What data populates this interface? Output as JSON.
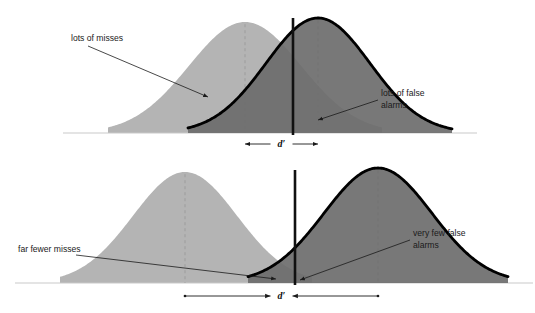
{
  "figure": {
    "panels": [
      {
        "id": "top",
        "name": "liberal-criterion-panel",
        "annotations": [
          {
            "id": "misses",
            "name": "lots-of-misses",
            "text": "lots of misses",
            "lines": [
              "lots of misses"
            ]
          },
          {
            "id": "false-alarms",
            "name": "lots-of-false-alarms",
            "text": "lots of false alarms",
            "lines": [
              "lots of false",
              "alarms"
            ]
          }
        ],
        "dprime_label": "d′",
        "criterion_label": "criterion"
      },
      {
        "id": "bottom",
        "name": "conservative-criterion-panel",
        "annotations": [
          {
            "id": "misses",
            "name": "far-fewer-misses",
            "text": "far fewer misses",
            "lines": [
              "far fewer misses"
            ]
          },
          {
            "id": "false-alarms",
            "name": "very-few-false-alarms",
            "text": "very few false alarms",
            "lines": [
              "very few false",
              "alarms"
            ]
          }
        ],
        "dprime_label": "d′",
        "criterion_label": "criterion"
      }
    ],
    "colors": {
      "noise_fill": "#b4b4b4",
      "signal_fill": "#6d6d6d",
      "overlap_fill": "#8d8d8d",
      "outline": "#000000",
      "baseline": "#c9c9c9",
      "mean_dash": "#9a9a9a",
      "text": "#1a1a1a",
      "background": "#ffffff"
    }
  },
  "chart_data": {
    "type": "line",
    "subtitle": "",
    "xlabel": "",
    "ylabel": "",
    "grid": false,
    "legend_position": "none",
    "axis_ranges": {
      "top_xlim": [
        0,
        535
      ],
      "bottom_xlim": [
        0,
        535
      ]
    },
    "panels": [
      {
        "id": "top",
        "label": "liberal criterion",
        "baseline_y": 133,
        "series": [
          {
            "name": "noise",
            "fill": "#b4b4b4",
            "outlined": false,
            "mean_x": 245,
            "peak_y": 22,
            "sigma_px": 56,
            "left_x": 108,
            "right_x": 382
          },
          {
            "name": "signal",
            "fill": "#6d6d6d",
            "outlined": true,
            "mean_x": 318,
            "peak_y": 18,
            "sigma_px": 52,
            "left_x": 188,
            "right_x": 452
          }
        ],
        "criterion": {
          "x": 293,
          "y_top": 18,
          "y_bottom": 135
        },
        "dprime": {
          "label": "d′",
          "from_x": 245,
          "to_x": 318,
          "y": 144,
          "arrow_left": true,
          "arrow_right": true
        },
        "annotation_leaders": [
          {
            "name": "lots-of-misses-leader",
            "from_x": 88,
            "from_y": 46,
            "to_x": 208,
            "to_y": 97
          },
          {
            "name": "lots-of-false-alarms-leader",
            "from_x": 378,
            "from_y": 100,
            "to_x": 318,
            "to_y": 120
          }
        ]
      },
      {
        "id": "bottom",
        "label": "conservative criterion",
        "baseline_y": 283,
        "series": [
          {
            "name": "noise",
            "fill": "#b4b4b4",
            "outlined": false,
            "mean_x": 185,
            "peak_y": 172,
            "sigma_px": 52,
            "left_x": 60,
            "right_x": 312
          },
          {
            "name": "signal",
            "fill": "#6d6d6d",
            "outlined": true,
            "mean_x": 378,
            "peak_y": 168,
            "sigma_px": 54,
            "left_x": 248,
            "right_x": 508
          }
        ],
        "criterion": {
          "x": 295,
          "y_top": 170,
          "y_bottom": 285
        },
        "dprime": {
          "label": "d′",
          "from_x": 185,
          "to_x": 378,
          "y": 296,
          "arrow_left": true,
          "arrow_right": true
        },
        "annotation_leaders": [
          {
            "name": "far-fewer-misses-leader",
            "from_x": 76,
            "from_y": 255,
            "to_x": 276,
            "to_y": 279
          },
          {
            "name": "very-few-false-alarms-leader",
            "from_x": 410,
            "from_y": 240,
            "to_x": 300,
            "to_y": 280
          }
        ]
      }
    ]
  }
}
